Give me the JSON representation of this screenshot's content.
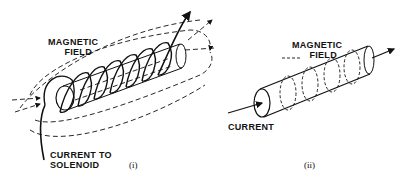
{
  "figure_i": {
    "field_label_line1": "MAGNETIC",
    "field_label_line2": "FIELD",
    "current_label_line1": "CURRENT TO",
    "current_label_line2": "SOLENOID",
    "caption": "(i)"
  },
  "figure_ii": {
    "field_label_line1": "MAGNETIC",
    "field_label_line2": "FIELD",
    "current_label": "CURRENT",
    "caption": "(ii)"
  },
  "colors": {
    "ink": "#111111",
    "background": "#ffffff"
  }
}
